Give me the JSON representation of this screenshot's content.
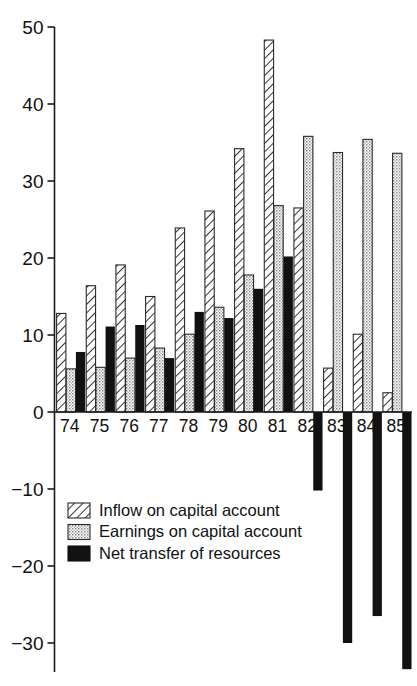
{
  "chart_data": {
    "type": "bar",
    "title": "",
    "subtitle": "",
    "xlabel": "",
    "ylabel": "",
    "categories": [
      "74",
      "75",
      "76",
      "77",
      "78",
      "79",
      "80",
      "81",
      "82",
      "83",
      "84",
      "85"
    ],
    "series": [
      {
        "name": "Inflow on capital account",
        "pattern": "diagonal-hatch",
        "color": "#ffffff",
        "values": [
          12.8,
          16.4,
          19.1,
          15.0,
          23.9,
          26.1,
          34.2,
          48.3,
          26.5,
          5.7,
          10.1,
          2.5
        ]
      },
      {
        "name": "Earnings on capital account",
        "pattern": "stipple-dots",
        "color": "#d8d8d8",
        "values": [
          5.6,
          5.8,
          7.0,
          8.3,
          10.1,
          13.6,
          17.8,
          26.8,
          35.8,
          33.7,
          35.4,
          33.6
        ]
      },
      {
        "name": "Net transfer of resources",
        "pattern": "solid-black",
        "color": "#111111",
        "values": [
          7.8,
          11.1,
          11.3,
          7.0,
          13.0,
          12.2,
          16.0,
          20.2,
          -10.2,
          -30.0,
          -26.5,
          -33.4
        ]
      }
    ],
    "yticks": [
      50,
      40,
      30,
      20,
      10,
      0,
      -10,
      -20,
      -30
    ],
    "ytick_labels": [
      "50",
      "40",
      "30",
      "20",
      "10",
      "0",
      "−10",
      "−20",
      "−30"
    ],
    "ylim": [
      -34.5,
      50
    ],
    "grid": false,
    "legend_position": "bottom-left"
  },
  "legend": {
    "items": [
      {
        "label": "Inflow on capital account",
        "swatch": "diagonal-hatch-swatch"
      },
      {
        "label": "Earnings on capital account",
        "swatch": "stipple-dots-swatch"
      },
      {
        "label": "Net transfer of resources",
        "swatch": "solid-black-swatch"
      }
    ]
  }
}
